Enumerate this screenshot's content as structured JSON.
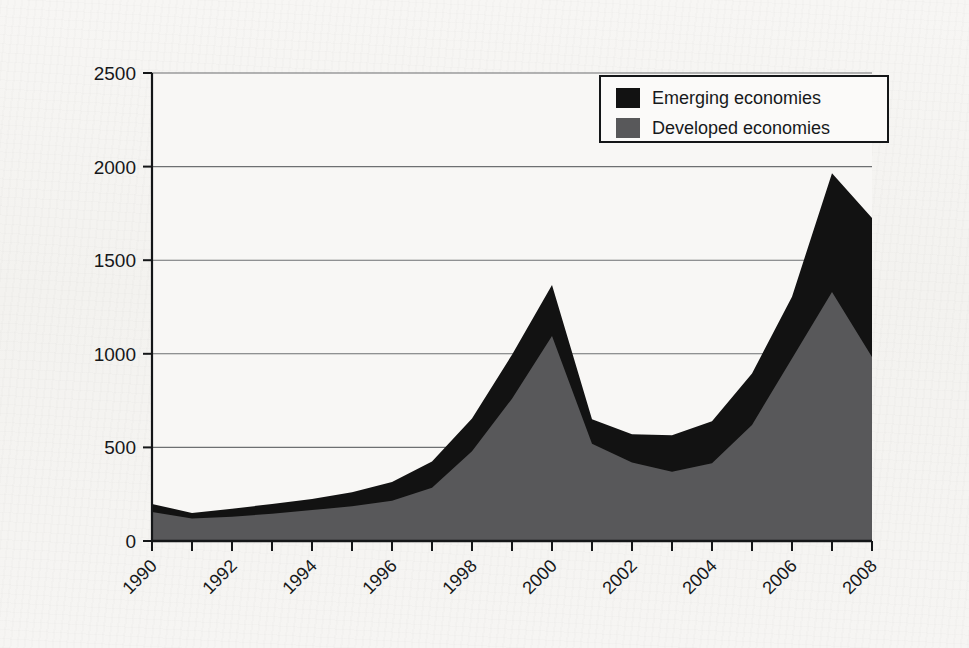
{
  "figure": {
    "background_color": "#f5f4f2",
    "plot_background_color": "#f7f6f4"
  },
  "chart_data": {
    "type": "area",
    "stacked": true,
    "title": "",
    "subtitle": "",
    "xlabel": "",
    "ylabel": "",
    "xlim": [
      1990,
      2008
    ],
    "ylim": [
      0,
      2500
    ],
    "yticks": [
      0,
      500,
      1000,
      1500,
      2000,
      2500
    ],
    "ytick_labels": [
      "0",
      "500",
      "1000",
      "1500",
      "2000",
      "2500"
    ],
    "xticks": [
      1990,
      1991,
      1992,
      1993,
      1994,
      1995,
      1996,
      1997,
      1998,
      1999,
      2000,
      2001,
      2002,
      2003,
      2004,
      2005,
      2006,
      2007,
      2008
    ],
    "xtick_labels_shown": [
      "1990",
      "1992",
      "1994",
      "1996",
      "1998",
      "2000",
      "2002",
      "2004",
      "2006",
      "2008"
    ],
    "xtick_label_rotation_deg": 45,
    "grid": "horizontal",
    "grid_color": "#6d6f71",
    "legend_position": "top-right",
    "x": [
      1990,
      1991,
      1992,
      1993,
      1994,
      1995,
      1996,
      1997,
      1998,
      1999,
      2000,
      2001,
      2002,
      2003,
      2004,
      2005,
      2006,
      2007,
      2008
    ],
    "series": [
      {
        "name": "Developed economies",
        "color": "#58585a",
        "stack_order": 1,
        "values": [
          155,
          120,
          130,
          145,
          165,
          185,
          215,
          285,
          480,
          760,
          1095,
          520,
          420,
          370,
          415,
          620,
          975,
          1330,
          983
        ]
      },
      {
        "name": "Emerging economies",
        "color": "#121212",
        "stack_order": 2,
        "values": [
          43,
          30,
          42,
          53,
          60,
          75,
          100,
          140,
          175,
          235,
          273,
          130,
          150,
          195,
          225,
          275,
          330,
          635,
          743
        ]
      }
    ],
    "totals": [
      198,
      150,
      172,
      198,
      225,
      260,
      315,
      425,
      655,
      995,
      1368,
      650,
      570,
      565,
      640,
      895,
      1305,
      1965,
      1726
    ],
    "annotations": []
  },
  "legend": {
    "items": [
      {
        "label": "Emerging economies",
        "swatch_color": "#121212"
      },
      {
        "label": "Developed economies",
        "swatch_color": "#58585a"
      }
    ]
  },
  "axes": {
    "y_tick_labels": [
      "2500",
      "2000",
      "1500",
      "1000",
      "500",
      "0"
    ],
    "x_tick_labels": [
      "1990",
      "1992",
      "1994",
      "1996",
      "1998",
      "2000",
      "2002",
      "2004",
      "2006",
      "2008"
    ]
  }
}
